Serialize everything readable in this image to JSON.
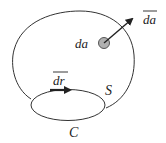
{
  "diagram": {
    "type": "surface-and-boundary-curve",
    "labels": {
      "surface": "S",
      "curve": "C",
      "area_element": "da",
      "area_vector": "da",
      "line_element": "dr"
    },
    "colors": {
      "stroke": "#333333",
      "dot_fill": "#b0b0b0",
      "dot_stroke": "#555555",
      "text": "#222222"
    }
  }
}
